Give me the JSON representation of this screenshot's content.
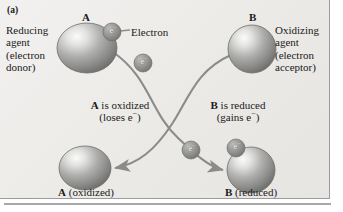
{
  "figure": {
    "panel_tag": "(a)",
    "title_internal": "Oxidation-reduction (redox) electron transfer diagram"
  },
  "labels": {
    "reducing_agent": "Reducing\nagent\n(electron\ndonor)",
    "oxidizing_agent": "Oxidizing\nagent\n(electron\nacceptor)",
    "electron_callout": "Electron",
    "a_top": "A",
    "b_top": "B",
    "a_oxidized_line1_bold": "A",
    "a_oxidized_line1_rest": " is oxidized",
    "a_oxidized_line2": "(loses e",
    "a_oxidized_line2_sup": "−",
    "a_oxidized_line2_end": ")",
    "b_reduced_line1_bold": "B",
    "b_reduced_line1_rest": " is reduced",
    "b_reduced_line2": "(gains e",
    "b_reduced_line2_sup": "−",
    "b_reduced_line2_end": ")",
    "a_bottom_bold": "A",
    "a_bottom_rest": " (oxidized)",
    "b_bottom_bold": "B",
    "b_bottom_rest": " (reduced)"
  },
  "electrons": [
    {
      "name": "electron-on-a",
      "label": "e",
      "charge": "−",
      "cx": 112,
      "cy": 32,
      "r": 9
    },
    {
      "name": "electron-leaving-a",
      "label": "e",
      "charge": "−",
      "cx": 143,
      "cy": 63,
      "r": 9
    },
    {
      "name": "electron-midway-to-b",
      "label": "e",
      "charge": "−",
      "cx": 191,
      "cy": 150,
      "r": 9
    },
    {
      "name": "electron-arriving-b",
      "label": "e",
      "charge": "−",
      "cx": 236,
      "cy": 148,
      "r": 9
    }
  ],
  "spheres": [
    {
      "name": "sphere-a-top",
      "cx": 87,
      "cy": 48,
      "rx": 30,
      "ry": 25
    },
    {
      "name": "sphere-b-top",
      "cx": 252,
      "cy": 49,
      "rx": 24,
      "ry": 24
    },
    {
      "name": "sphere-a-oxidized",
      "cx": 85,
      "cy": 168,
      "rx": 26,
      "ry": 22
    },
    {
      "name": "sphere-b-reduced",
      "cx": 251,
      "cy": 170,
      "rx": 24,
      "ry": 23
    }
  ],
  "colors": {
    "background": "#eeedeb",
    "sphere_light": "#f4f4f3",
    "sphere_mid": "#9d9d9c",
    "sphere_dark": "#6f6f6e",
    "arrow": "#8b8b8a",
    "text": "#1a1a1a",
    "frame": "#9b9b9b",
    "electron_text": "#ffffff"
  },
  "arrows": [
    {
      "name": "arrow-a-to-b-path",
      "description": "curve from sphere A down and right ending at sphere B reduced",
      "from": "sphere-a-top",
      "to": "sphere-b-reduced"
    },
    {
      "name": "arrow-b-to-a-path",
      "description": "curve from sphere B down and left ending at sphere A oxidized",
      "from": "sphere-b-top",
      "to": "sphere-a-oxidized"
    }
  ]
}
